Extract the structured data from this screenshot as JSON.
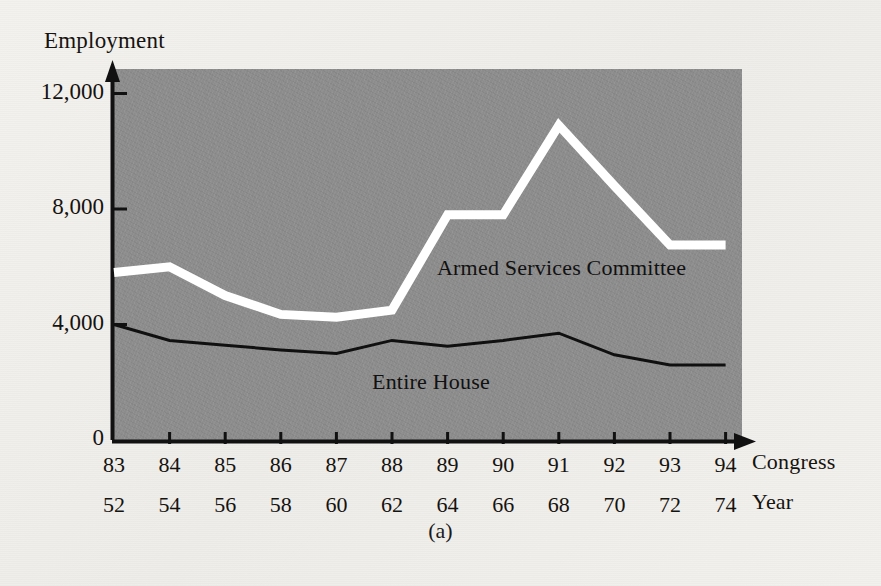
{
  "figure": {
    "caption": "(a)",
    "y_axis_title": "Employment",
    "x_axis_title_primary": "Congress",
    "x_axis_title_secondary": "Year"
  },
  "colors": {
    "plot_background": "#8c8c8c",
    "page_background": "#f2f0ec",
    "armed_services_line": "#ffffff",
    "entire_house_line": "#101010",
    "axis": "#111111",
    "text": "#15130f"
  },
  "chart_data": {
    "type": "line",
    "title": "Employment",
    "xlabel": "Congress",
    "ylabel": "Employment",
    "categories": [
      "83",
      "84",
      "85",
      "86",
      "87",
      "88",
      "89",
      "90",
      "91",
      "92",
      "93",
      "94"
    ],
    "secondary_categories": [
      "52",
      "54",
      "56",
      "58",
      "60",
      "62",
      "64",
      "66",
      "68",
      "70",
      "72",
      "74"
    ],
    "secondary_xlabel": "Year",
    "yticks": [
      0,
      4000,
      8000,
      12000
    ],
    "ytick_labels": [
      "0",
      "4,000",
      "8,000",
      "12,000"
    ],
    "ylim": [
      0,
      12800
    ],
    "grid": false,
    "legend": "inline-annotation",
    "series": [
      {
        "name": "Armed Services Committee",
        "color": "#ffffff",
        "line_width": 9,
        "values": [
          5800,
          6000,
          5000,
          4350,
          4250,
          4500,
          7800,
          7800,
          10900,
          8800,
          6750,
          6750
        ]
      },
      {
        "name": "Entire House",
        "color": "#101010",
        "line_width": 3,
        "values": [
          4000,
          3450,
          3280,
          3120,
          3000,
          3450,
          3250,
          3450,
          3700,
          2950,
          2600,
          2600
        ]
      }
    ],
    "annotations": [
      {
        "text": "Armed Services Committee",
        "x_px": 437,
        "y_px": 255
      },
      {
        "text": "Entire House",
        "x_px": 372,
        "y_px": 369
      }
    ]
  }
}
